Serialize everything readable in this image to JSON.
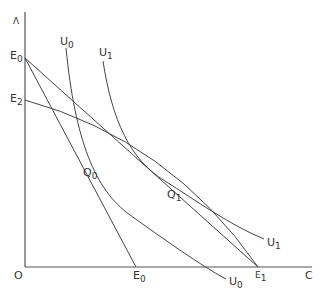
{
  "diagram": {
    "axes": {
      "y_label": "Λ",
      "x_label": "C",
      "origin_label": "O"
    },
    "labels": {
      "e0_top": {
        "main": "E",
        "sub": "0"
      },
      "e2": {
        "main": "E",
        "sub": "2"
      },
      "e0_axis": {
        "main": "E",
        "sub": "0"
      },
      "e1": {
        "main": "E",
        "sub": "1"
      },
      "u0_top": {
        "main": "U",
        "sub": "0"
      },
      "u1_top": {
        "main": "U",
        "sub": "1"
      },
      "u0_end": {
        "main": "U",
        "sub": "0"
      },
      "u1_end": {
        "main": "U",
        "sub": "1"
      },
      "q0": {
        "main": "Q",
        "sub": "0"
      },
      "q1": {
        "main": "Q",
        "sub": "1"
      }
    },
    "line_color": "#444444"
  }
}
